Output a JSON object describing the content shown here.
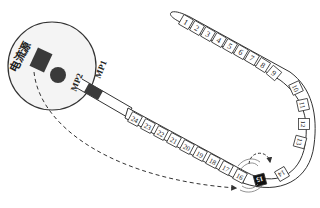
{
  "diagram": {
    "source_label": "电流源",
    "mp1_label": "MP1",
    "mp2_label": "MP2",
    "segments": [
      "1",
      "2",
      "3",
      "4",
      "5",
      "6",
      "7",
      "8",
      "9",
      "10",
      "11",
      "12",
      "13",
      "14",
      "15",
      "16",
      "17",
      "18",
      "19",
      "20",
      "21",
      "22",
      "23",
      "24"
    ],
    "highlighted_segment": "15",
    "colors": {
      "stroke": "#333333",
      "dark_fill": "#3a3a3a",
      "highlight_fill": "#111111",
      "highlight_text": "#ffffff",
      "circle_fill": "#f4f4f4"
    }
  }
}
